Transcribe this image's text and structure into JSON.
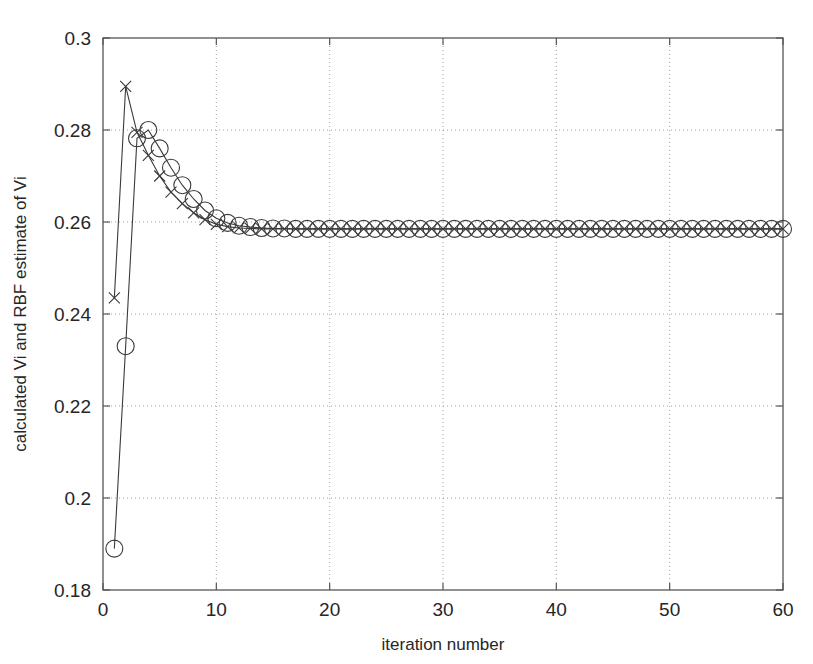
{
  "chart_data": {
    "type": "line",
    "title": "",
    "xlabel": "iteration number",
    "ylabel": "calculated Vi and RBF estimate of Vi",
    "xlim": [
      0,
      60
    ],
    "ylim": [
      0.18,
      0.3
    ],
    "xticks": [
      0,
      10,
      20,
      30,
      40,
      50,
      60
    ],
    "yticks": [
      0.18,
      0.2,
      0.22,
      0.24,
      0.26,
      0.28,
      0.3
    ],
    "xtick_labels": [
      "0",
      "10",
      "20",
      "30",
      "40",
      "50",
      "60"
    ],
    "ytick_labels": [
      "0.18",
      "0.2",
      "0.22",
      "0.24",
      "0.26",
      "0.28",
      "0.3"
    ],
    "grid": true,
    "grid_style": "dotted",
    "legend": "none",
    "x": [
      1,
      2,
      3,
      4,
      5,
      6,
      7,
      8,
      9,
      10,
      11,
      12,
      13,
      14,
      15,
      16,
      17,
      18,
      19,
      20,
      21,
      22,
      23,
      24,
      25,
      26,
      27,
      28,
      29,
      30,
      31,
      32,
      33,
      34,
      35,
      36,
      37,
      38,
      39,
      40,
      41,
      42,
      43,
      44,
      45,
      46,
      47,
      48,
      49,
      50,
      51,
      52,
      53,
      54,
      55,
      56,
      57,
      58,
      59,
      60
    ],
    "series": [
      {
        "name": "calculated Vi",
        "marker": "circle",
        "values": [
          0.189,
          0.233,
          0.2782,
          0.28,
          0.276,
          0.2718,
          0.268,
          0.265,
          0.2625,
          0.2608,
          0.2598,
          0.2592,
          0.2589,
          0.2587,
          0.2586,
          0.2586,
          0.2585,
          0.2585,
          0.2585,
          0.2585,
          0.2585,
          0.2585,
          0.2585,
          0.2585,
          0.2585,
          0.2585,
          0.2585,
          0.2585,
          0.2585,
          0.2585,
          0.2585,
          0.2585,
          0.2585,
          0.2585,
          0.2585,
          0.2585,
          0.2585,
          0.2585,
          0.2585,
          0.2585,
          0.2585,
          0.2585,
          0.2585,
          0.2585,
          0.2585,
          0.2585,
          0.2585,
          0.2585,
          0.2585,
          0.2585,
          0.2585,
          0.2585,
          0.2585,
          0.2585,
          0.2585,
          0.2585,
          0.2585,
          0.2585,
          0.2585,
          0.2585
        ]
      },
      {
        "name": "RBF estimate of Vi",
        "marker": "cross",
        "values": [
          0.2435,
          0.2895,
          0.2795,
          0.2745,
          0.27,
          0.2665,
          0.264,
          0.262,
          0.2605,
          0.2595,
          0.259,
          0.2587,
          0.2586,
          0.2585,
          0.2585,
          0.2585,
          0.2585,
          0.2585,
          0.2585,
          0.2585,
          0.2585,
          0.2585,
          0.2585,
          0.2585,
          0.2585,
          0.2585,
          0.2585,
          0.2585,
          0.2585,
          0.2585,
          0.2585,
          0.2585,
          0.2585,
          0.2585,
          0.2585,
          0.2585,
          0.2585,
          0.2585,
          0.2585,
          0.2585,
          0.2585,
          0.2585,
          0.2585,
          0.2585,
          0.2585,
          0.2585,
          0.2585,
          0.2585,
          0.2585,
          0.2585,
          0.2585,
          0.2585,
          0.2585,
          0.2585,
          0.2585,
          0.2585,
          0.2585,
          0.2585,
          0.2585,
          0.2585
        ]
      }
    ]
  }
}
